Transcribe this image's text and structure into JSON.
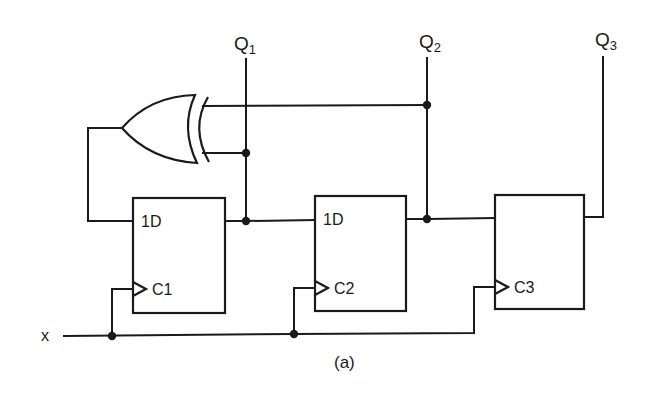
{
  "diagram": {
    "type": "circuit-schematic",
    "caption": "(a)",
    "input": {
      "label": "x"
    },
    "outputs": [
      {
        "main": "Q",
        "sub": "1"
      },
      {
        "main": "Q",
        "sub": "2"
      },
      {
        "main": "Q",
        "sub": "3"
      }
    ],
    "gates": [
      {
        "type": "XOR",
        "inputs": [
          "Q2",
          "Q1"
        ],
        "output": "FF1.1D"
      }
    ],
    "flip_flops": [
      {
        "id": "FF1",
        "data_label": "1D",
        "clock_label": "C1"
      },
      {
        "id": "FF2",
        "data_label": "1D",
        "clock_label": "C2"
      },
      {
        "id": "FF3",
        "data_label": "",
        "clock_label": "C3"
      }
    ],
    "colors": {
      "ink": "#1a1a1a",
      "background": "#ffffff"
    }
  }
}
